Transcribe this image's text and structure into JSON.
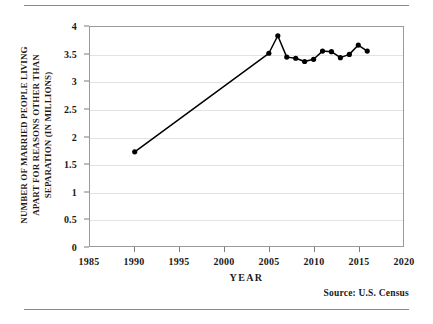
{
  "figure": {
    "y_axis_title_lines": [
      "NUMBER OF MARRIED PEOPLE LIVING",
      "APART FOR REASONS OTHER THAN",
      "SEPARATION (IN MILLIONS)"
    ],
    "x_axis_title": "YEAR",
    "source_note": "Source:  U.S. Census",
    "line_color": "#000000",
    "marker_color": "#000000",
    "grid_color": "#e2e2e2",
    "frame_color": "#9a9a9a",
    "rule_color": "#8a8a8a"
  },
  "chart_data": {
    "type": "line",
    "title": "",
    "subtitle": "",
    "xlabel": "YEAR",
    "ylabel": "NUMBER OF MARRIED PEOPLE LIVING APART FOR REASONS OTHER THAN SEPARATION (IN MILLIONS)",
    "xlim": [
      1985,
      2020
    ],
    "ylim": [
      0,
      4
    ],
    "xticks": [
      1985,
      1990,
      1995,
      2000,
      2005,
      2010,
      2015,
      2020
    ],
    "xtick_labels": [
      "1985",
      "1990",
      "1995",
      "2000",
      "2005",
      "2010",
      "2015",
      "2020"
    ],
    "yticks": [
      0,
      0.5,
      1,
      1.5,
      2,
      2.5,
      3,
      3.5,
      4
    ],
    "ytick_labels": [
      "0",
      "0.5",
      "1",
      "1.5",
      "2",
      "2.5",
      "3",
      "3.5",
      "4"
    ],
    "grid": true,
    "grid_axis": "y",
    "legend": false,
    "legend_position": "none",
    "annotations": [
      "Source:  U.S. Census"
    ],
    "series": [
      {
        "name": "Married people living apart for reasons other than separation",
        "marker": "circle",
        "x": [
          1990,
          2005,
          2006,
          2007,
          2008,
          2009,
          2010,
          2011,
          2012,
          2013,
          2014,
          2015,
          2016
        ],
        "values": [
          1.72,
          3.52,
          3.84,
          3.45,
          3.43,
          3.37,
          3.41,
          3.56,
          3.55,
          3.44,
          3.5,
          3.67,
          3.56
        ]
      }
    ]
  }
}
